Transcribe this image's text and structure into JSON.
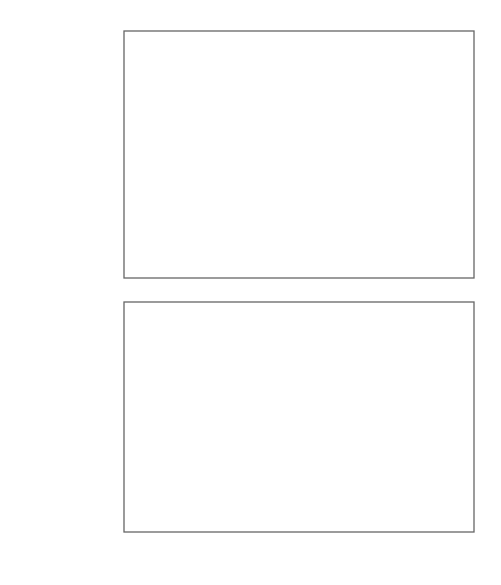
{
  "chart_data": [
    {
      "type": "line",
      "panel": "top",
      "title": "",
      "xlabel": "t, °C",
      "ylabel": "ε_f, rel. units",
      "xlim": [
        62,
        221
      ],
      "ylim": [
        0.0,
        1.1
      ],
      "x_ticks": [
        80,
        100,
        120,
        140,
        160,
        180,
        200
      ],
      "y_ticks": [
        0.1,
        0.3,
        0.5,
        0.7,
        0.9
      ],
      "y_tick_labels": [
        "0,1",
        "0,3",
        "0,5",
        "0,7",
        "0,9"
      ],
      "grid": false,
      "series": [
        {
          "name": "ε_f (measured)",
          "marker": "open-circle",
          "x": [
            76,
            102,
            130,
            151,
            176,
            205,
            220
          ],
          "y": [
            1.0,
            1.0,
            0.99,
            0.12,
            0.045,
            0.03,
            0.025
          ]
        },
        {
          "name": "ε_f (fitted curve)",
          "marker": "none",
          "line": "solid",
          "x": [
            62,
            130,
            133,
            137,
            142,
            147,
            151,
            160,
            176,
            200,
            221
          ],
          "y": [
            1.0,
            0.99,
            0.75,
            0.48,
            0.28,
            0.17,
            0.12,
            0.07,
            0.04,
            0.025,
            0.02
          ]
        }
      ]
    },
    {
      "type": "line",
      "panel": "bottom",
      "title": "",
      "xlabel": "t, °C",
      "ylabel": "Δl/T, μm/deg",
      "xlim": [
        62,
        221
      ],
      "ylim": [
        0.31,
        0.411
      ],
      "x_ticks": [
        80,
        100,
        120,
        140,
        160,
        180,
        200
      ],
      "x_tick_labels": [
        "80",
        "100",
        "120",
        "140",
        "160",
        "180",
        "t, °C"
      ],
      "y_ticks": [
        0.31,
        0.33,
        0.35,
        0.37,
        0.39
      ],
      "y_tick_labels": [
        "0,310",
        "0,330",
        "0,350",
        "0,370",
        "0,390"
      ],
      "grid": false,
      "series": [
        {
          "name": "Δl/T (measured)",
          "marker": "open-circle",
          "x": [
            89,
            99,
            108,
            120,
            130,
            137,
            142,
            146,
            149,
            153,
            156,
            160,
            165,
            168,
            171,
            176,
            180,
            185,
            190,
            198,
            204,
            210,
            220
          ],
          "y": [
            0.319,
            0.338,
            0.341,
            0.35,
            0.354,
            0.353,
            0.355,
            0.36,
            0.369,
            0.374,
            0.377,
            0.383,
            0.383,
            0.385,
            0.389,
            0.387,
            0.39,
            0.389,
            0.391,
            0.397,
            0.397,
            0.396,
            0.4
          ]
        },
        {
          "name": "Δl/T (fitted curve)",
          "marker": "none",
          "line": "solid",
          "x": [
            80,
            100,
            120,
            130,
            140,
            145,
            149,
            155,
            160,
            170,
            180,
            190,
            200,
            210,
            220
          ],
          "y": [
            0.314,
            0.336,
            0.35,
            0.352,
            0.353,
            0.357,
            0.366,
            0.377,
            0.382,
            0.387,
            0.39,
            0.393,
            0.396,
            0.398,
            0.4
          ]
        },
        {
          "name": "Δl/T (extrapolated, dashed)",
          "marker": "none",
          "line": "dashed",
          "x": [
            120,
            152
          ],
          "y": [
            0.35,
            0.371
          ]
        }
      ]
    }
  ],
  "labels": {
    "top_ylabel": "ε",
    "top_ylabel_sub": "f",
    "top_ylabel_rest": ", rel. units",
    "bottom_ylabel_delta": "Δ",
    "bottom_ylabel_italic": "l/T",
    "bottom_ylabel_rest": ", μm/deg",
    "x_axis_unit_italic": "t",
    "x_axis_unit_rest": ", °C"
  }
}
